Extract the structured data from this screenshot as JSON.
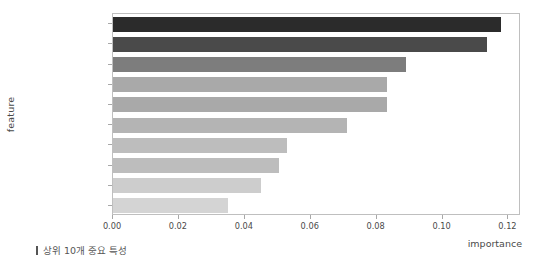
{
  "chart_data": {
    "type": "bar",
    "orientation": "horizontal",
    "title": "",
    "xlabel": "importance",
    "ylabel": "feature",
    "categories": [
      "r3m_avg_bill",
      "r3m_data_use",
      "tving_interest",
      "disney_interest",
      "netflix_interest",
      "customer_class_VIP",
      "customer_class_VVIP",
      "youtube_interest",
      "customer_class_Silver",
      "customer_class_Gold"
    ],
    "values": [
      0.1178,
      0.1136,
      0.0889,
      0.0832,
      0.0831,
      0.0709,
      0.0527,
      0.0505,
      0.045,
      0.035
    ],
    "bar_colors": [
      "#2b2b2b",
      "#4a4a4a",
      "#7d7d7d",
      "#a9a9a9",
      "#a9a9a9",
      "#b4b4b4",
      "#bdbdbd",
      "#bdbdbd",
      "#cdcdcd",
      "#d4d4d4"
    ],
    "xlim": [
      0.0,
      0.1238
    ],
    "xticks": [
      0.0,
      0.02,
      0.04,
      0.06,
      0.08,
      0.1,
      0.12
    ],
    "xtick_labels": [
      "0.00",
      "0.02",
      "0.04",
      "0.06",
      "0.08",
      "0.10",
      "0.12"
    ],
    "grid": false,
    "legend": null
  },
  "caption": {
    "text": "상위 10개 중요 특성"
  },
  "colors": {
    "frame": "#bfbfbf",
    "text": "#4a4a4a",
    "background": "#ffffff"
  }
}
